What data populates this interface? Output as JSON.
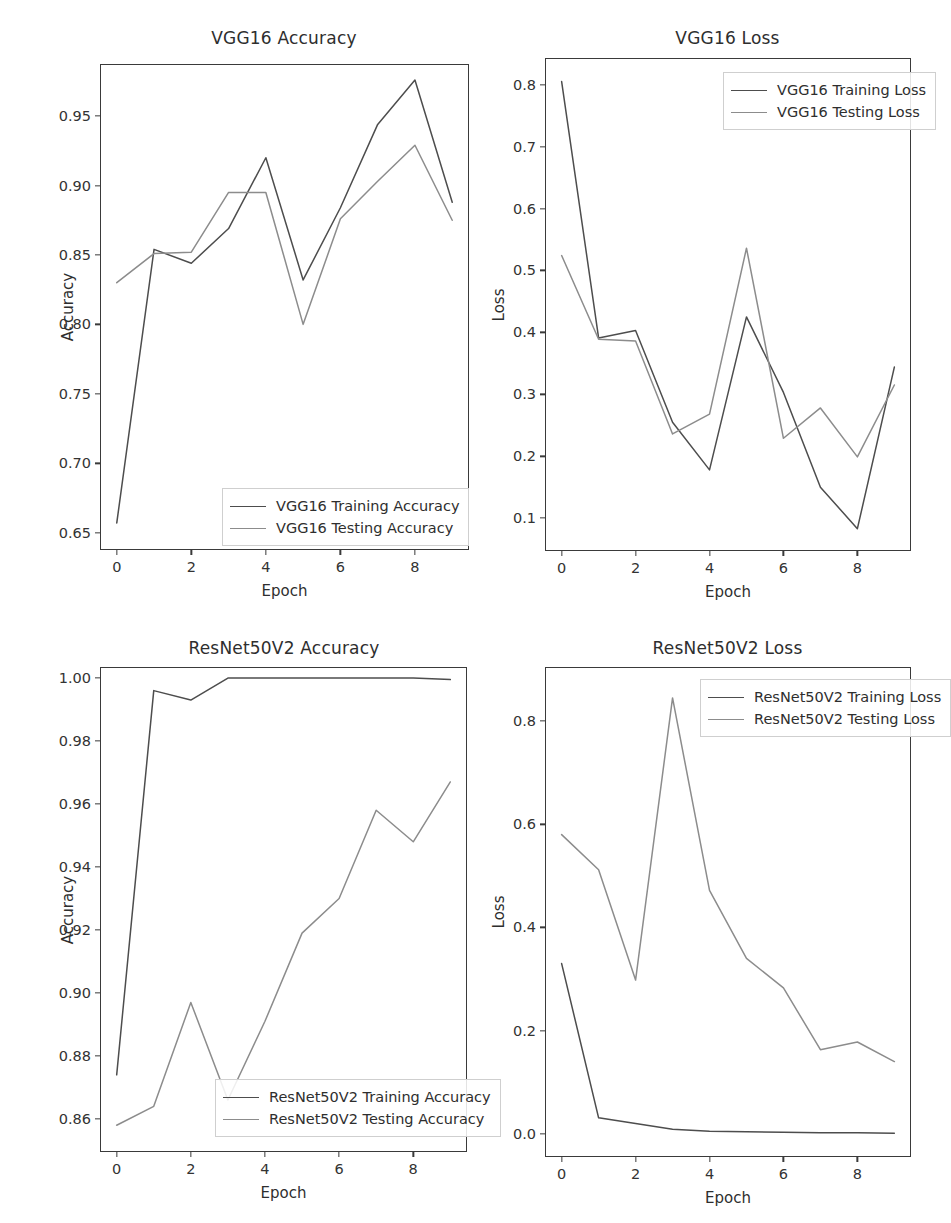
{
  "figure": {
    "background_color": "#ffffff",
    "axis_color": "#3a3a3a",
    "train_color": "#4d4d4d",
    "test_color": "#8c8c8c"
  },
  "panels": [
    {
      "key": "vgg16_accuracy",
      "title": "VGG16 Accuracy",
      "xlabel": "Epoch",
      "ylabel": "Accuracy",
      "legend": {
        "train_label": "VGG16 Training Accuracy",
        "test_label": "VGG16 Testing Accuracy"
      }
    },
    {
      "key": "vgg16_loss",
      "title": "VGG16 Loss",
      "xlabel": "Epoch",
      "ylabel": "Loss",
      "legend": {
        "train_label": "VGG16 Training Loss",
        "test_label": "VGG16 Testing Loss"
      }
    },
    {
      "key": "resnet50v2_accuracy",
      "title": "ResNet50V2 Accuracy",
      "xlabel": "Epoch",
      "ylabel": "Accuracy",
      "legend": {
        "train_label": "ResNet50V2 Training Accuracy",
        "test_label": "ResNet50V2 Testing Accuracy"
      }
    },
    {
      "key": "resnet50v2_loss",
      "title": "ResNet50V2 Loss",
      "xlabel": "Epoch",
      "ylabel": "Loss",
      "legend": {
        "train_label": "ResNet50V2 Training Loss",
        "test_label": "ResNet50V2 Testing Loss"
      }
    }
  ],
  "chart_data": [
    {
      "id": "vgg16_accuracy",
      "type": "line",
      "title": "VGG16 Accuracy",
      "xlabel": "Epoch",
      "ylabel": "Accuracy",
      "x": [
        0,
        1,
        2,
        3,
        4,
        5,
        6,
        7,
        8,
        9
      ],
      "xticks": [
        0,
        2,
        4,
        6,
        8
      ],
      "xticklabels": [
        "0",
        "2",
        "4",
        "6",
        "8"
      ],
      "yticks": [
        0.65,
        0.7,
        0.75,
        0.8,
        0.85,
        0.9,
        0.95
      ],
      "yticklabels": [
        "0.65",
        "0.70",
        "0.75",
        "0.80",
        "0.85",
        "0.90",
        "0.95"
      ],
      "xlim": [
        -0.45,
        9.45
      ],
      "ylim": [
        0.6375,
        0.9875
      ],
      "grid": false,
      "legend_position": "lower right",
      "series": [
        {
          "name": "VGG16 Training Accuracy",
          "color": "#4d4d4d",
          "values": [
            0.657,
            0.854,
            0.844,
            0.869,
            0.92,
            0.832,
            0.884,
            0.944,
            0.976,
            0.888
          ]
        },
        {
          "name": "VGG16 Testing Accuracy",
          "color": "#8c8c8c",
          "values": [
            0.83,
            0.851,
            0.852,
            0.895,
            0.895,
            0.8,
            0.876,
            0.903,
            0.929,
            0.875
          ]
        }
      ]
    },
    {
      "id": "vgg16_loss",
      "type": "line",
      "title": "VGG16 Loss",
      "xlabel": "Epoch",
      "ylabel": "Loss",
      "x": [
        0,
        1,
        2,
        3,
        4,
        5,
        6,
        7,
        8,
        9
      ],
      "xticks": [
        0,
        2,
        4,
        6,
        8
      ],
      "xticklabels": [
        "0",
        "2",
        "4",
        "6",
        "8"
      ],
      "yticks": [
        0.1,
        0.2,
        0.3,
        0.4,
        0.5,
        0.6,
        0.7,
        0.8
      ],
      "yticklabels": [
        "0.1",
        "0.2",
        "0.3",
        "0.4",
        "0.5",
        "0.6",
        "0.7",
        "0.8"
      ],
      "xlim": [
        -0.45,
        9.45
      ],
      "ylim": [
        0.047,
        0.843
      ],
      "grid": false,
      "legend_position": "upper right",
      "series": [
        {
          "name": "VGG16 Training Loss",
          "color": "#4d4d4d",
          "values": [
            0.805,
            0.391,
            0.403,
            0.255,
            0.178,
            0.425,
            0.303,
            0.15,
            0.083,
            0.344
          ]
        },
        {
          "name": "VGG16 Testing Loss",
          "color": "#8c8c8c",
          "values": [
            0.524,
            0.389,
            0.386,
            0.236,
            0.268,
            0.536,
            0.229,
            0.278,
            0.199,
            0.315
          ]
        }
      ]
    },
    {
      "id": "resnet50v2_accuracy",
      "type": "line",
      "title": "ResNet50V2 Accuracy",
      "xlabel": "Epoch",
      "ylabel": "Accuracy",
      "x": [
        0,
        1,
        2,
        3,
        4,
        5,
        6,
        7,
        8,
        9
      ],
      "xticks": [
        0,
        2,
        4,
        6,
        8
      ],
      "xticklabels": [
        "0",
        "2",
        "4",
        "6",
        "8"
      ],
      "yticks": [
        0.86,
        0.88,
        0.9,
        0.92,
        0.94,
        0.96,
        0.98,
        1.0
      ],
      "yticklabels": [
        "0.86",
        "0.88",
        "0.90",
        "0.92",
        "0.94",
        "0.96",
        "0.98",
        "1.00"
      ],
      "xlim": [
        -0.45,
        9.45
      ],
      "ylim": [
        0.8495,
        1.0035
      ],
      "grid": false,
      "legend_position": "lower right",
      "series": [
        {
          "name": "ResNet50V2 Training Accuracy",
          "color": "#4d4d4d",
          "values": [
            0.874,
            0.996,
            0.993,
            1.0,
            1.0,
            1.0,
            1.0,
            1.0,
            1.0,
            0.9995
          ]
        },
        {
          "name": "ResNet50V2 Testing Accuracy",
          "color": "#8c8c8c",
          "values": [
            0.858,
            0.864,
            0.897,
            0.866,
            0.891,
            0.919,
            0.93,
            0.958,
            0.948,
            0.967
          ]
        }
      ]
    },
    {
      "id": "resnet50v2_loss",
      "type": "line",
      "title": "ResNet50V2 Loss",
      "xlabel": "Epoch",
      "ylabel": "Loss",
      "x": [
        0,
        1,
        2,
        3,
        4,
        5,
        6,
        7,
        8,
        9
      ],
      "xticks": [
        0,
        2,
        4,
        6,
        8
      ],
      "xticklabels": [
        "0",
        "2",
        "4",
        "6",
        "8"
      ],
      "yticks": [
        0.0,
        0.2,
        0.4,
        0.6,
        0.8
      ],
      "yticklabels": [
        "0.0",
        "0.2",
        "0.4",
        "0.6",
        "0.8"
      ],
      "xlim": [
        -0.45,
        9.45
      ],
      "ylim": [
        -0.045,
        0.905
      ],
      "grid": false,
      "legend_position": "upper right",
      "series": [
        {
          "name": "ResNet50V2 Training Loss",
          "color": "#4d4d4d",
          "values": [
            0.33,
            0.031,
            0.02,
            0.009,
            0.005,
            0.004,
            0.003,
            0.002,
            0.002,
            0.001
          ]
        },
        {
          "name": "ResNet50V2 Testing Loss",
          "color": "#8c8c8c",
          "values": [
            0.58,
            0.512,
            0.298,
            0.845,
            0.472,
            0.34,
            0.283,
            0.163,
            0.178,
            0.14
          ]
        }
      ]
    }
  ]
}
